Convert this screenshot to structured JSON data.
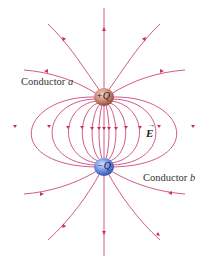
{
  "diagram": {
    "conductor_a": {
      "label": "Conductor",
      "letter": "a",
      "charge": "+Q",
      "color": "#c47a66"
    },
    "conductor_b": {
      "label": "Conductor",
      "letter": "b",
      "charge": "−Q",
      "color": "#5a7fd6"
    },
    "field_label": "E",
    "field_arrow": "→",
    "line_color": "#c8306a"
  }
}
